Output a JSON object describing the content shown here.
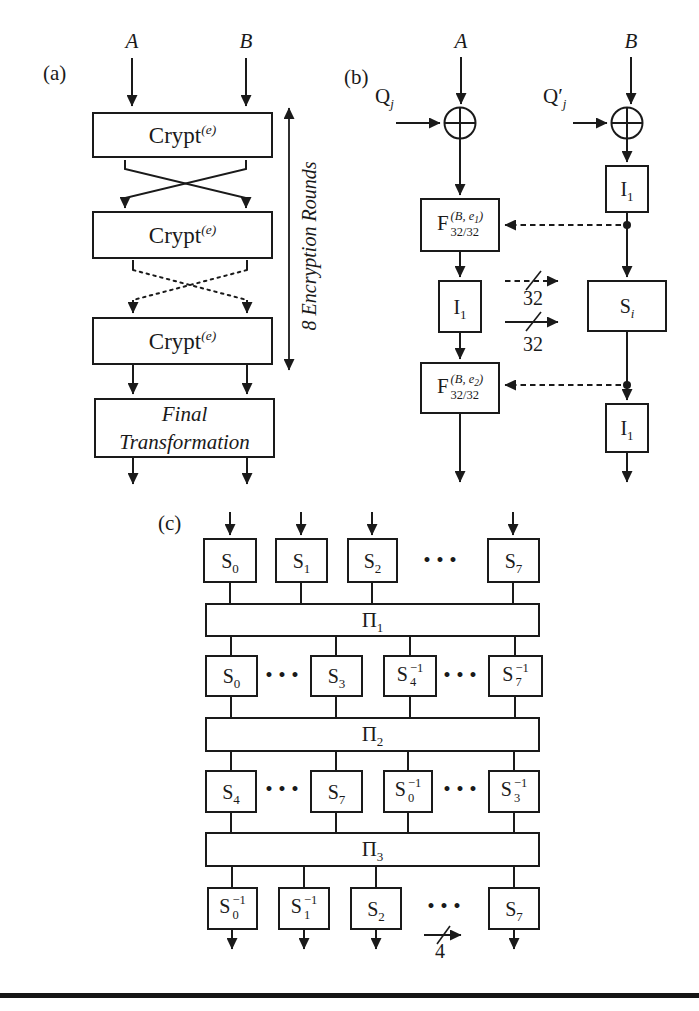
{
  "panel_a": {
    "label": "(a)",
    "input_left": "A",
    "input_right": "B",
    "crypt1": {
      "base": "Crypt",
      "sup": "(e)"
    },
    "crypt2": {
      "base": "Crypt",
      "sup": "(e)"
    },
    "crypt3": {
      "base": "Crypt",
      "sup": "(e)"
    },
    "rounds_label": "8 Encryption Rounds",
    "final_box": {
      "line1": "Final",
      "line2": "Transformation"
    }
  },
  "panel_b": {
    "label": "(b)",
    "input_left": "A",
    "input_right": "B",
    "key_left": {
      "base": "Q",
      "sub": "j"
    },
    "key_right": {
      "base": "Q′",
      "sub": "j"
    },
    "f1": {
      "base": "F",
      "sup_pre": "(B, e",
      "sup_digit": "1",
      "sup_post": ")",
      "sub": "32/32"
    },
    "f2": {
      "base": "F",
      "sup_pre": "(B, e",
      "sup_digit": "2",
      "sup_post": ")",
      "sub": "32/32"
    },
    "i1_left": {
      "base": "I",
      "sub": "1"
    },
    "i1_right_top": {
      "base": "I",
      "sub": "1"
    },
    "i1_right_bottom": {
      "base": "I",
      "sub": "1"
    },
    "s_box": {
      "base": "S",
      "sub": "i"
    },
    "bus_top": "32",
    "bus_bottom": "32"
  },
  "panel_c": {
    "label": "(c)",
    "row1": [
      {
        "base": "S",
        "sub": "0"
      },
      {
        "base": "S",
        "sub": "1"
      },
      {
        "base": "S",
        "sub": "2"
      },
      {
        "base": "S",
        "sub": "7"
      }
    ],
    "row1_dots": "•••",
    "pi1": {
      "base": "Π",
      "sub": "1"
    },
    "row2": [
      {
        "base": "S",
        "sub": "0"
      },
      {
        "base": "S",
        "sub": "3"
      },
      {
        "base": "S",
        "sub": "4",
        "sup": "−1"
      },
      {
        "base": "S",
        "sub": "7",
        "sup": "−1"
      }
    ],
    "row2_dots_left": "•••",
    "row2_dots_right": "•••",
    "pi2": {
      "base": "Π",
      "sub": "2"
    },
    "row3": [
      {
        "base": "S",
        "sub": "4"
      },
      {
        "base": "S",
        "sub": "7"
      },
      {
        "base": "S",
        "sub": "0",
        "sup": "−1"
      },
      {
        "base": "S",
        "sub": "3",
        "sup": "−1"
      }
    ],
    "row3_dots_left": "•••",
    "row3_dots_right": "•••",
    "pi3": {
      "base": "Π",
      "sub": "3"
    },
    "row4": [
      {
        "base": "S",
        "sub": "0",
        "sup": "−1"
      },
      {
        "base": "S",
        "sub": "1",
        "sup": "−1"
      },
      {
        "base": "S",
        "sub": "2"
      },
      {
        "base": "S",
        "sub": "7"
      }
    ],
    "row4_dots": "•••",
    "bus_label": "4"
  },
  "colors": {
    "ink": "#1a1a1a",
    "background": "#ffffff"
  }
}
